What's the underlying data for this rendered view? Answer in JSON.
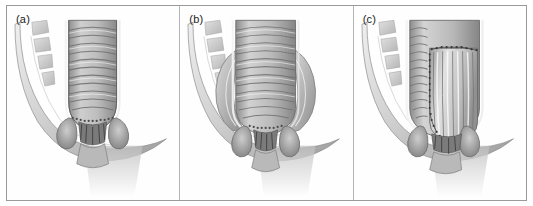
{
  "figure": {
    "background_color": "#ffffff",
    "frame_color": "#9a9a9a",
    "divider_color": "#b4b4b4",
    "ink_color": "#1b1b1b",
    "panel_count": 3
  },
  "panels": [
    {
      "label": "(a)",
      "name": "panel-a",
      "caption_text": "(a)",
      "structures": [
        "sacral-vertebrae",
        "pelvic-floor-muscle",
        "rectum",
        "rectal-mucosal-folds",
        "anal-sphincter-complex",
        "anal-canal"
      ],
      "rectum_width": "narrow",
      "suture_line": "dentate-line-stipple"
    },
    {
      "label": "(b)",
      "name": "panel-b",
      "caption_text": "(b)",
      "structures": [
        "sacral-vertebrae",
        "pelvic-floor-muscle",
        "rectum-distended",
        "rectal-mucosal-folds",
        "lateral-levator-wings",
        "anal-sphincter-complex",
        "anal-canal"
      ],
      "rectum_width": "wide",
      "suture_line": "dentate-line-stipple"
    },
    {
      "label": "(c)",
      "name": "panel-c",
      "caption_text": "(c)",
      "structures": [
        "sacral-vertebrae",
        "pelvic-floor-muscle",
        "rectum-outer-wall",
        "inner-pouch-reconstruction",
        "vertical-suture-line",
        "horizontal-suture-line",
        "anal-sphincter-complex",
        "anal-canal"
      ],
      "rectum_width": "wide",
      "suture_line": "pouch-anastomosis-stitches"
    }
  ],
  "palette": {
    "bone_light": "#d6d6d6",
    "bone_mid": "#bdbdbd",
    "muscle_light": "#e3e3e3",
    "muscle_mid": "#c4c4c4",
    "muscle_dark": "#8f8f8f",
    "mucosa_light": "#cfcfcf",
    "mucosa_mid": "#a8a8a8",
    "mucosa_dark": "#717171",
    "outline": "#5e5e5e",
    "shadow": "#9e9e9e"
  },
  "vertebrae": {
    "count": 4,
    "name": "sacral-vertebral-segments"
  }
}
